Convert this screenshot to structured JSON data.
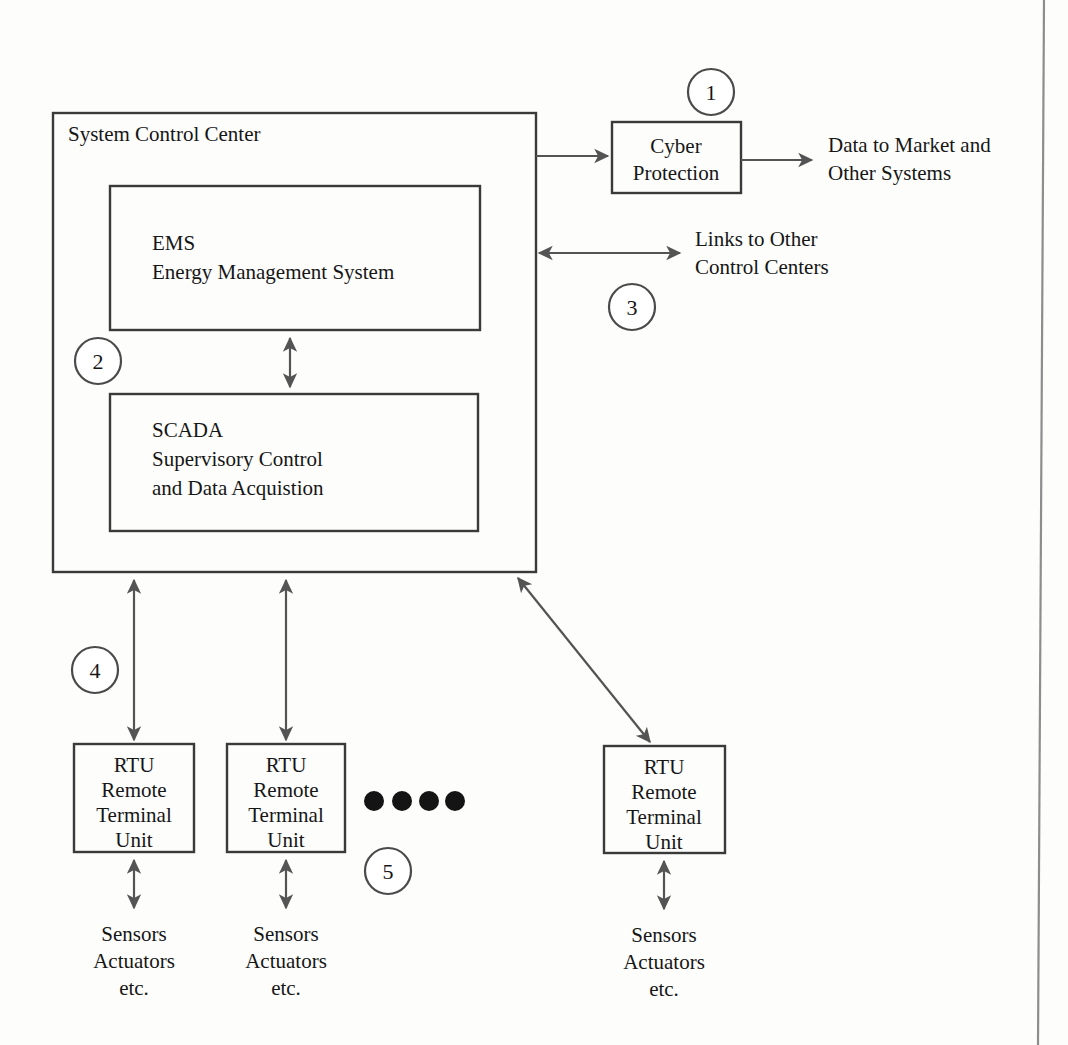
{
  "figure": {
    "kind": "block-diagram",
    "colors": {
      "background": "#fdfdfc",
      "stroke": "#3a3a3a",
      "connector": "#545454",
      "text": "#161616",
      "dot": "#141414",
      "page_edge": "#8d8d8d"
    }
  },
  "outer_box": {
    "title": "System Control Center"
  },
  "blocks": {
    "ems": {
      "line1": "EMS",
      "line2": "Energy Management System"
    },
    "scada": {
      "line1": "SCADA",
      "line2": "Supervisory Control",
      "line3": "and Data Acquistion"
    },
    "cyber": {
      "line1": "Cyber",
      "line2": "Protection"
    },
    "rtu1": {
      "line1": "RTU",
      "line2": "Remote",
      "line3": "Terminal",
      "line4": "Unit"
    },
    "rtu2": {
      "line1": "RTU",
      "line2": "Remote",
      "line3": "Terminal",
      "line4": "Unit"
    },
    "rtu3": {
      "line1": "RTU",
      "line2": "Remote",
      "line3": "Terminal",
      "line4": "Unit"
    }
  },
  "labels": {
    "data_to_market": {
      "line1": "Data to Market and",
      "line2": "Other Systems"
    },
    "links_other_cc": {
      "line1": "Links to Other",
      "line2": "Control Centers"
    },
    "sensors1": {
      "line1": "Sensors",
      "line2": "Actuators",
      "line3": "etc."
    },
    "sensors2": {
      "line1": "Sensors",
      "line2": "Actuators",
      "line3": "etc."
    },
    "sensors3": {
      "line1": "Sensors",
      "line2": "Actuators",
      "line3": "etc."
    }
  },
  "callouts": [
    {
      "number": "1",
      "refers_to": "Cyber Protection"
    },
    {
      "number": "2",
      "refers_to": "EMS / SCADA link inside control center"
    },
    {
      "number": "3",
      "refers_to": "Links to Other Control Centers"
    },
    {
      "number": "4",
      "refers_to": "Control center to RTU link"
    },
    {
      "number": "5",
      "refers_to": "Additional RTUs (ellipsis)"
    }
  ],
  "ellipsis": {
    "dot_count": 4,
    "meaning": "more RTUs"
  }
}
